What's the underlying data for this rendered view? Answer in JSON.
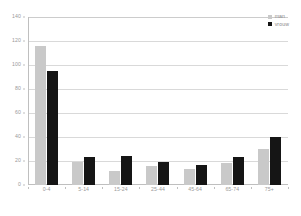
{
  "chart_data": {
    "type": "bar",
    "title": "",
    "xlabel": "",
    "ylabel": "",
    "categories": [
      "0-4",
      "5-14",
      "15-24",
      "25-44",
      "45-64",
      "65-74",
      "75+"
    ],
    "series": [
      {
        "name": "man",
        "color": "#c9c9c9",
        "values": [
          116,
          19,
          12,
          16,
          13,
          18,
          30
        ]
      },
      {
        "name": "vrouw",
        "color": "#151515",
        "values": [
          95,
          23,
          24,
          19,
          17,
          23,
          40
        ]
      }
    ],
    "ylim": [
      0,
      140
    ],
    "yticks": [
      0,
      20,
      40,
      60,
      80,
      100,
      120,
      140
    ],
    "ytick_labels": [
      "0",
      "20",
      "40",
      "60",
      "80",
      "100",
      "120",
      "140"
    ],
    "grid": true,
    "legend_position": "top-right"
  },
  "legend": {
    "entries": [
      {
        "label": "man"
      },
      {
        "label": "vrouw"
      }
    ]
  }
}
